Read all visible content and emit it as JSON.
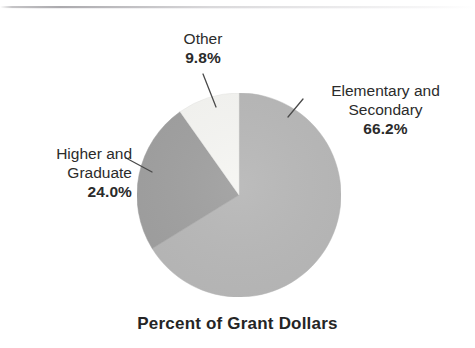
{
  "chart_data": {
    "type": "pie",
    "title": "Percent of Grant Dollars",
    "xlabel": "",
    "ylabel": "",
    "legend_position": "callout-labels",
    "grid": false,
    "start_angle_deg": 0,
    "direction": "clockwise",
    "units": "percent",
    "categories": [
      "Elementary and Secondary",
      "Higher and Graduate",
      "Other"
    ],
    "values": [
      66.2,
      24.0,
      9.8
    ],
    "slices": [
      {
        "label_line1": "Elementary and",
        "label_line2": "Secondary",
        "value": 66.2,
        "value_label": "66.2%",
        "color": "#b5b5b5"
      },
      {
        "label_line1": "Higher and",
        "label_line2": "Graduate",
        "value": 24.0,
        "value_label": "24.0%",
        "color": "#9c9c9c"
      },
      {
        "label_line1": "Other",
        "label_line2": "",
        "value": 9.8,
        "value_label": "9.8%",
        "color": "#f5f5f2"
      }
    ]
  },
  "figure": {
    "caption": "Percent of Grant Dollars"
  },
  "colors": {
    "slice_elementary": "#b5b5b5",
    "slice_higher": "#9c9c9c",
    "slice_other": "#f5f5f2",
    "text": "#2b2b2b",
    "leader_line": "#4a4a4a",
    "background": "#ffffff"
  }
}
